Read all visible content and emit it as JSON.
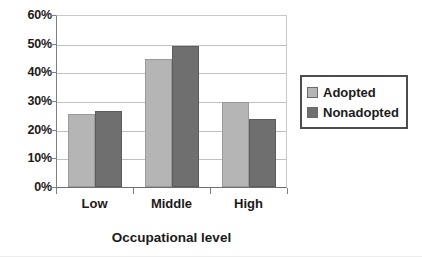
{
  "chart_data": {
    "type": "bar",
    "title": "",
    "subtitle": "",
    "xlabel": "Occupational level",
    "ylabel": "",
    "categories": [
      "Low",
      "Middle",
      "High"
    ],
    "series": [
      {
        "name": "Adopted",
        "values": [
          25.5,
          44.8,
          29.8
        ],
        "color": "#b5b5b5"
      },
      {
        "name": "Nonadopted",
        "values": [
          26.6,
          49.2,
          23.6
        ],
        "color": "#6f6f6f"
      }
    ],
    "ylim": [
      0,
      60
    ],
    "ytick_labels": [
      "0%",
      "10%",
      "20%",
      "30%",
      "40%",
      "50%",
      "60%"
    ],
    "ytick_values": [
      0,
      10,
      20,
      30,
      40,
      50,
      60
    ],
    "grid": true,
    "legend_position": "right",
    "legend_entries": [
      "Adopted",
      "Nonadopted"
    ],
    "value_format": "percent"
  }
}
